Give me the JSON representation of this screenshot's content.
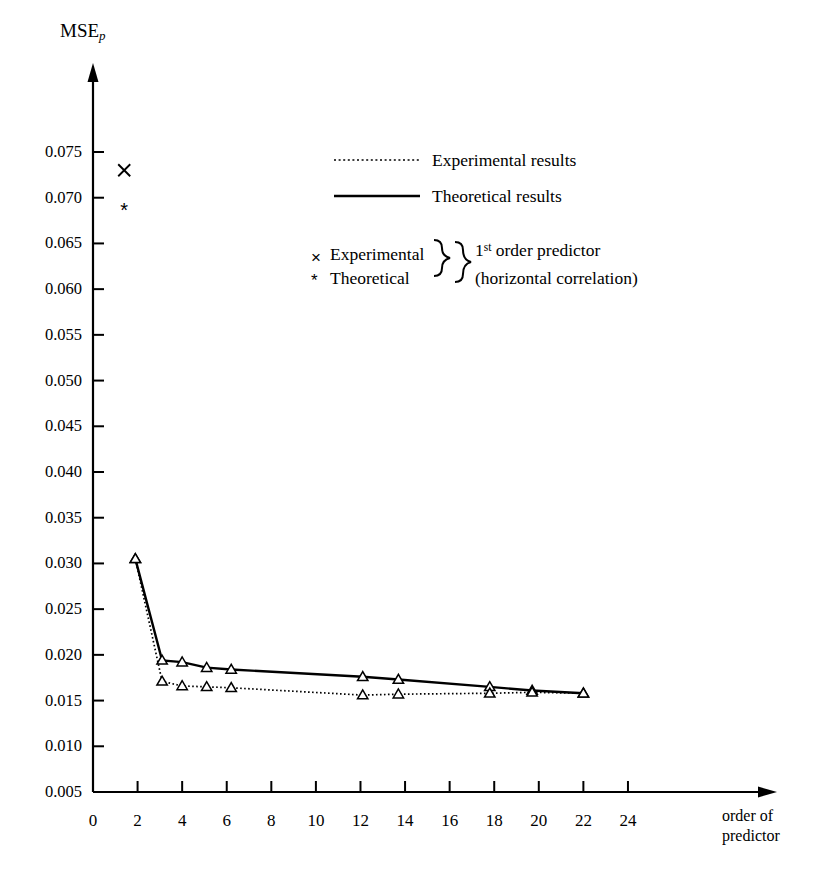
{
  "chart_data": {
    "type": "line",
    "title": "",
    "xlabel": "order of predictor",
    "ylabel": "MSE_p",
    "ylabel_main": "MSE",
    "ylabel_sub": "p",
    "xlim": [
      0,
      26.5
    ],
    "ylim": [
      0.005,
      0.0785
    ],
    "xticks": [
      0,
      2,
      4,
      6,
      8,
      10,
      12,
      14,
      16,
      18,
      20,
      22,
      24
    ],
    "xtick_labels": [
      "0",
      "2",
      "4",
      "6",
      "8",
      "10",
      "12",
      "14",
      "16",
      "18",
      "20",
      "22",
      "24"
    ],
    "yticks": [
      0.005,
      0.01,
      0.015,
      0.02,
      0.025,
      0.03,
      0.035,
      0.04,
      0.045,
      0.05,
      0.055,
      0.06,
      0.065,
      0.07,
      0.075
    ],
    "ytick_labels": [
      "0.005",
      "0.010",
      "0.015",
      "0.020",
      "0.025",
      "0.030",
      "0.035",
      "0.040",
      "0.045",
      "0.050",
      "0.055",
      "0.060",
      "0.065",
      "0.070",
      "0.075"
    ],
    "grid": false,
    "legend_position": "upper-center",
    "series": [
      {
        "name": "Theoretical results",
        "style": "solid",
        "marker": "triangle",
        "points": [
          {
            "x": 1.9,
            "y": 0.0305
          },
          {
            "x": 3.1,
            "y": 0.0194
          },
          {
            "x": 4.0,
            "y": 0.0192
          },
          {
            "x": 5.1,
            "y": 0.0186
          },
          {
            "x": 6.2,
            "y": 0.0184
          },
          {
            "x": 12.1,
            "y": 0.0176
          },
          {
            "x": 13.7,
            "y": 0.0173
          },
          {
            "x": 17.8,
            "y": 0.0165
          },
          {
            "x": 19.7,
            "y": 0.0161
          },
          {
            "x": 22.0,
            "y": 0.0158
          }
        ]
      },
      {
        "name": "Experimental results",
        "style": "dotted",
        "marker": "triangle",
        "points": [
          {
            "x": 1.9,
            "y": 0.0305
          },
          {
            "x": 3.1,
            "y": 0.0171
          },
          {
            "x": 4.0,
            "y": 0.0166
          },
          {
            "x": 5.1,
            "y": 0.0165
          },
          {
            "x": 6.2,
            "y": 0.0164
          },
          {
            "x": 12.1,
            "y": 0.0156
          },
          {
            "x": 13.7,
            "y": 0.0157
          },
          {
            "x": 17.8,
            "y": 0.0158
          },
          {
            "x": 19.7,
            "y": 0.0159
          },
          {
            "x": 22.0,
            "y": 0.0158
          }
        ]
      }
    ],
    "standalone_points": [
      {
        "name": "Experimental 1st order predictor",
        "marker": "x",
        "x": 1.4,
        "y": 0.073
      },
      {
        "name": "Theoretical 1st order predictor",
        "marker": "asterisk",
        "x": 1.4,
        "y": 0.0685
      }
    ]
  },
  "legend": {
    "line_entries": [
      {
        "label": "Experimental results",
        "style": "dotted"
      },
      {
        "label": "Theoretical results",
        "style": "solid"
      }
    ],
    "marker_entries": [
      {
        "symbol": "×",
        "label": "Experimental"
      },
      {
        "symbol": "*",
        "label": "Theoretical"
      }
    ],
    "brace_note_line1_pre": "1",
    "brace_note_line1_sup": "st",
    "brace_note_line1_post": " order predictor",
    "brace_note_line2": "(horizontal correlation)"
  },
  "axes": {
    "x_axis_name_line1": "order of",
    "x_axis_name_line2": "predictor"
  },
  "colors": {
    "foreground": "#000000",
    "background": "#ffffff"
  }
}
